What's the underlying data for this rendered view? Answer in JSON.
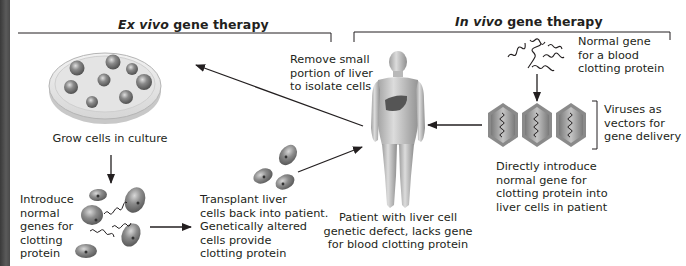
{
  "sections": {
    "ex_vivo": {
      "title_italic": "Ex vivo",
      "title_rest": " gene therapy"
    },
    "in_vivo": {
      "title_italic": "In vivo",
      "title_rest": " gene therapy"
    }
  },
  "labels": {
    "grow_cells": "Grow cells in culture",
    "introduce_genes": "Introduce\nnormal\ngenes for\nclotting\nprotein",
    "transplant": "Transplant liver\ncells back into patient.\nGenetically altered\ncells provide\nclotting protein",
    "remove_liver": "Remove small\nportion of liver\nto isolate cells",
    "patient": "Patient with liver cell\ngenetic defect, lacks gene\nfor blood clotting protein",
    "normal_gene": "Normal gene\nfor a blood\nclotting protein",
    "viruses": "Viruses as\nvectors for\ngene delivery",
    "directly_introduce": "Directly introduce\nnormal gene for\nclotting protein into\nliver cells in patient"
  },
  "icons": {
    "petri_dish": "petri-dish-icon",
    "cells": "cell-icon",
    "gene": "dna-strand-icon",
    "human": "human-body-icon",
    "liver": "liver-icon",
    "virus": "virus-icon"
  },
  "colors": {
    "text": "#231f20",
    "line": "#231f20",
    "cell_fill": "#8a8a8a",
    "skin": "#c9c9c9",
    "liver": "#555555",
    "virus_fill": "#a6a6a6"
  }
}
